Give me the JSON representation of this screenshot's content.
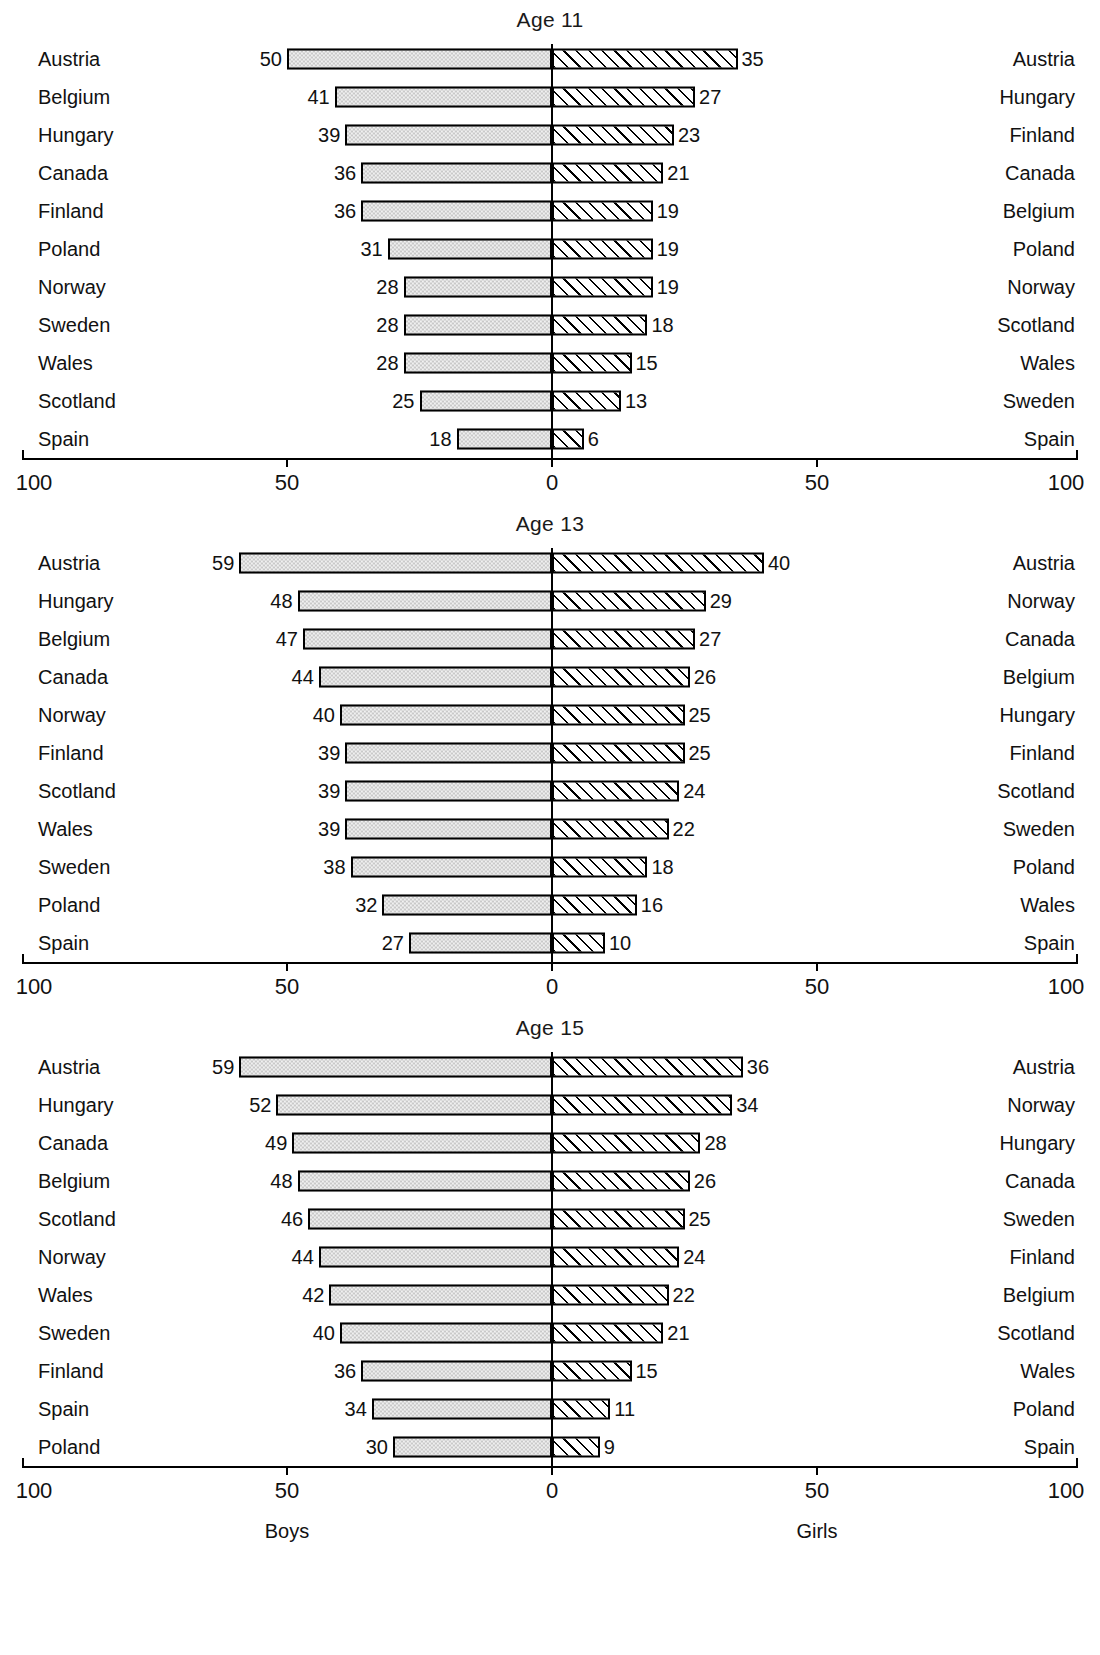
{
  "chart_data": {
    "type": "bar",
    "title": "",
    "subtitle": "",
    "xlabel": "",
    "ylabel": "",
    "xlim": [
      -100,
      100
    ],
    "grid": false,
    "legend_position": "bottom",
    "axis": {
      "tick_labels": [
        "100",
        "50",
        "0",
        "50",
        "100"
      ],
      "tick_values": [
        -100,
        -50,
        0,
        50,
        100
      ]
    },
    "side_labels": {
      "left": "Boys",
      "right": "Girls"
    },
    "panels": [
      {
        "title": "Age 11",
        "series": [
          {
            "name": "Boys",
            "side": "left",
            "fill": "stipple-gray"
          },
          {
            "name": "Girls",
            "side": "right",
            "fill": "diagonal-hatch"
          }
        ],
        "rows": [
          {
            "left_label": "Austria",
            "left_value": 50,
            "right_value": 35,
            "right_label": "Austria"
          },
          {
            "left_label": "Belgium",
            "left_value": 41,
            "right_value": 27,
            "right_label": "Hungary"
          },
          {
            "left_label": "Hungary",
            "left_value": 39,
            "right_value": 23,
            "right_label": "Finland"
          },
          {
            "left_label": "Canada",
            "left_value": 36,
            "right_value": 21,
            "right_label": "Canada"
          },
          {
            "left_label": "Finland",
            "left_value": 36,
            "right_value": 19,
            "right_label": "Belgium"
          },
          {
            "left_label": "Poland",
            "left_value": 31,
            "right_value": 19,
            "right_label": "Poland"
          },
          {
            "left_label": "Norway",
            "left_value": 28,
            "right_value": 19,
            "right_label": "Norway"
          },
          {
            "left_label": "Sweden",
            "left_value": 28,
            "right_value": 18,
            "right_label": "Scotland"
          },
          {
            "left_label": "Wales",
            "left_value": 28,
            "right_value": 15,
            "right_label": "Wales"
          },
          {
            "left_label": "Scotland",
            "left_value": 25,
            "right_value": 13,
            "right_label": "Sweden"
          },
          {
            "left_label": "Spain",
            "left_value": 18,
            "right_value": 6,
            "right_label": "Spain"
          }
        ]
      },
      {
        "title": "Age 13",
        "series": [
          {
            "name": "Boys",
            "side": "left",
            "fill": "stipple-gray"
          },
          {
            "name": "Girls",
            "side": "right",
            "fill": "diagonal-hatch"
          }
        ],
        "rows": [
          {
            "left_label": "Austria",
            "left_value": 59,
            "right_value": 40,
            "right_label": "Austria"
          },
          {
            "left_label": "Hungary",
            "left_value": 48,
            "right_value": 29,
            "right_label": "Norway"
          },
          {
            "left_label": "Belgium",
            "left_value": 47,
            "right_value": 27,
            "right_label": "Canada"
          },
          {
            "left_label": "Canada",
            "left_value": 44,
            "right_value": 26,
            "right_label": "Belgium"
          },
          {
            "left_label": "Norway",
            "left_value": 40,
            "right_value": 25,
            "right_label": "Hungary"
          },
          {
            "left_label": "Finland",
            "left_value": 39,
            "right_value": 25,
            "right_label": "Finland"
          },
          {
            "left_label": "Scotland",
            "left_value": 39,
            "right_value": 24,
            "right_label": "Scotland"
          },
          {
            "left_label": "Wales",
            "left_value": 39,
            "right_value": 22,
            "right_label": "Sweden"
          },
          {
            "left_label": "Sweden",
            "left_value": 38,
            "right_value": 18,
            "right_label": "Poland"
          },
          {
            "left_label": "Poland",
            "left_value": 32,
            "right_value": 16,
            "right_label": "Wales"
          },
          {
            "left_label": "Spain",
            "left_value": 27,
            "right_value": 10,
            "right_label": "Spain"
          }
        ]
      },
      {
        "title": "Age 15",
        "series": [
          {
            "name": "Boys",
            "side": "left",
            "fill": "stipple-gray"
          },
          {
            "name": "Girls",
            "side": "right",
            "fill": "diagonal-hatch"
          }
        ],
        "rows": [
          {
            "left_label": "Austria",
            "left_value": 59,
            "right_value": 36,
            "right_label": "Austria"
          },
          {
            "left_label": "Hungary",
            "left_value": 52,
            "right_value": 34,
            "right_label": "Norway"
          },
          {
            "left_label": "Canada",
            "left_value": 49,
            "right_value": 28,
            "right_label": "Hungary"
          },
          {
            "left_label": "Belgium",
            "left_value": 48,
            "right_value": 26,
            "right_label": "Canada"
          },
          {
            "left_label": "Scotland",
            "left_value": 46,
            "right_value": 25,
            "right_label": "Sweden"
          },
          {
            "left_label": "Norway",
            "left_value": 44,
            "right_value": 24,
            "right_label": "Finland"
          },
          {
            "left_label": "Wales",
            "left_value": 42,
            "right_value": 22,
            "right_label": "Belgium"
          },
          {
            "left_label": "Sweden",
            "left_value": 40,
            "right_value": 21,
            "right_label": "Scotland"
          },
          {
            "left_label": "Finland",
            "left_value": 36,
            "right_value": 15,
            "right_label": "Wales"
          },
          {
            "left_label": "Spain",
            "left_value": 34,
            "right_value": 11,
            "right_label": "Poland"
          },
          {
            "left_label": "Poland",
            "left_value": 30,
            "right_value": 9,
            "right_label": "Spain"
          }
        ]
      }
    ]
  }
}
